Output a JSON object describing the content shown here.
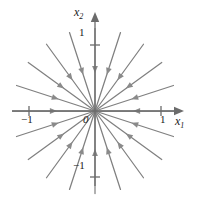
{
  "figure": {
    "background_color": "#ffffff"
  },
  "axes": {
    "x_axis_label": "x",
    "x_axis_subscript": "1",
    "y_axis_label": "x",
    "y_axis_subscript": "2",
    "origin_label": "0",
    "color": "#6b6b6b"
  },
  "ticks": {
    "x_positive": "1",
    "x_negative": "−1",
    "y_positive": "1",
    "y_negative": "−1"
  },
  "chart_data": {
    "type": "scatter",
    "title": "",
    "xlabel": "x₁",
    "ylabel": "x₂",
    "xlim": [
      -1.35,
      1.35
    ],
    "ylim": [
      -1.35,
      1.35
    ],
    "grid": false,
    "legend": null,
    "plot_kind": "phase-portrait-star-node",
    "stability": "stable (arrows point toward origin)",
    "equilibrium": [
      0,
      0
    ],
    "line_color": "#808080",
    "arrow_color": "#8a8a8a",
    "ray_count": 20,
    "ray_angles_deg": [
      0,
      18,
      36,
      54,
      72,
      90,
      108,
      126,
      144,
      162,
      180,
      198,
      216,
      234,
      252,
      270,
      288,
      306,
      324,
      342
    ],
    "ray_length_units": 1.25,
    "arrow_position_fraction": 0.5,
    "tick_values": {
      "x": [
        -1,
        1
      ],
      "y": [
        -1,
        1
      ]
    },
    "axis_ranges_pixels": {
      "origin_x": 95,
      "origin_y": 111,
      "unit_px": 66
    }
  }
}
